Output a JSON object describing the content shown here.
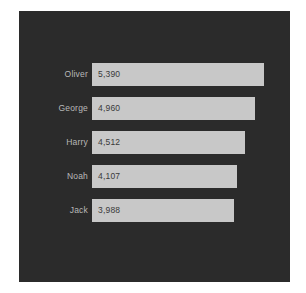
{
  "chart_data": {
    "type": "bar",
    "orientation": "horizontal",
    "title": "",
    "xlabel": "",
    "ylabel": "",
    "grid": false,
    "legend": null,
    "xlim": [
      0,
      5390
    ],
    "categories": [
      "Oliver",
      "George",
      "Harry",
      "Noah",
      "Jack"
    ],
    "values": [
      5390,
      4960,
      4512,
      4107,
      3988
    ],
    "value_labels": [
      "5,390",
      "4,960",
      "4,512",
      "4,107",
      "3,988"
    ],
    "bars": [
      {
        "category": "Oliver",
        "value": 5390,
        "label": "5,390"
      },
      {
        "category": "George",
        "value": 4960,
        "label": "4,960"
      },
      {
        "category": "Harry",
        "value": 4512,
        "label": "4,512"
      },
      {
        "category": "Noah",
        "value": 4107,
        "label": "4,107"
      },
      {
        "category": "Jack",
        "value": 3988,
        "label": "3,988"
      }
    ]
  },
  "style": {
    "panel_background": "#2b2b2b",
    "page_background": "#ffffff",
    "bar_color": "#c8c8c8",
    "category_label_color": "#b9b9b9",
    "value_label_color": "#3a3a3a"
  }
}
